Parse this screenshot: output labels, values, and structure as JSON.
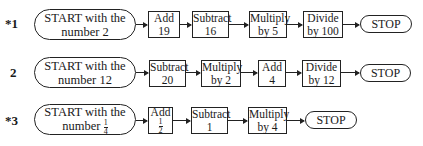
{
  "problems": [
    {
      "label": "*1",
      "start_line1": "START with the",
      "start_line2": "number 2",
      "steps": [
        {
          "l1": "Add",
          "l2": "19"
        },
        {
          "l1": "Subtract",
          "l2": "16"
        },
        {
          "l1": "Multiply",
          "l2": "by 5"
        },
        {
          "l1": "Divide",
          "l2": "by 100"
        }
      ],
      "stop": "STOP"
    },
    {
      "label": "2",
      "start_line1": "START with the",
      "start_line2": "number 12",
      "steps": [
        {
          "l1": "Subtract",
          "l2": "20"
        },
        {
          "l1": "Multiply",
          "l2": "by 2"
        },
        {
          "l1": "Add",
          "l2": "4"
        },
        {
          "l1": "Divide",
          "l2": "by 12"
        }
      ],
      "stop": "STOP"
    },
    {
      "label": "*3",
      "start_line1": "START with the",
      "start_line2": "number",
      "start_frac": {
        "num": "1",
        "den": "4"
      },
      "steps": [
        {
          "l1": "Add",
          "frac": {
            "num": "1",
            "den": "2"
          }
        },
        {
          "l1": "Subtract",
          "l2": "1"
        },
        {
          "l1": "Multiply",
          "l2": "by 4"
        }
      ],
      "stop": "STOP"
    }
  ]
}
